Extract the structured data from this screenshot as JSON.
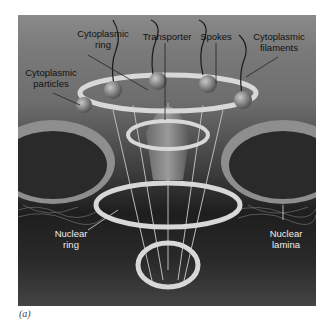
{
  "figure": {
    "caption": "(a)",
    "labels": {
      "cytoplasmic_ring": "Cytoplasmic\nring",
      "transporter": "Transporter",
      "spokes": "Spokes",
      "cytoplasmic_filaments": "Cytoplasmic\nfilaments",
      "cytoplasmic_particles": "Cytoplasmic\nparticles",
      "nuclear_ring": "Nuclear\nring",
      "nuclear_lamina": "Nuclear\nlamina"
    },
    "colors": {
      "background_top": "#8a8a8a",
      "background_bottom": "#1e1e1e",
      "ring": "#d8d8d8",
      "label_dark": "#111111",
      "label_light": "#eeeeee"
    }
  }
}
